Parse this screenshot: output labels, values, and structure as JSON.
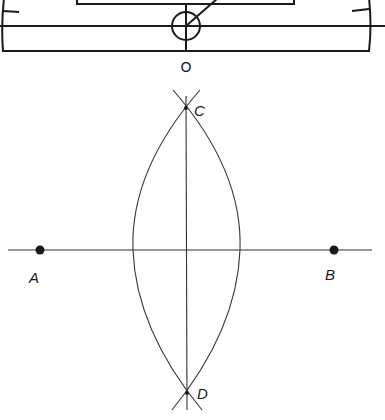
{
  "figure": {
    "protractor": {
      "origin_label": "O"
    },
    "construction": {
      "points": [
        {
          "id": "A",
          "label": "A"
        },
        {
          "id": "B",
          "label": "B"
        },
        {
          "id": "C",
          "label": "C"
        },
        {
          "id": "D",
          "label": "D"
        }
      ]
    },
    "colors": {
      "ink": "#1a1a1a",
      "background": "#ffffff"
    }
  }
}
